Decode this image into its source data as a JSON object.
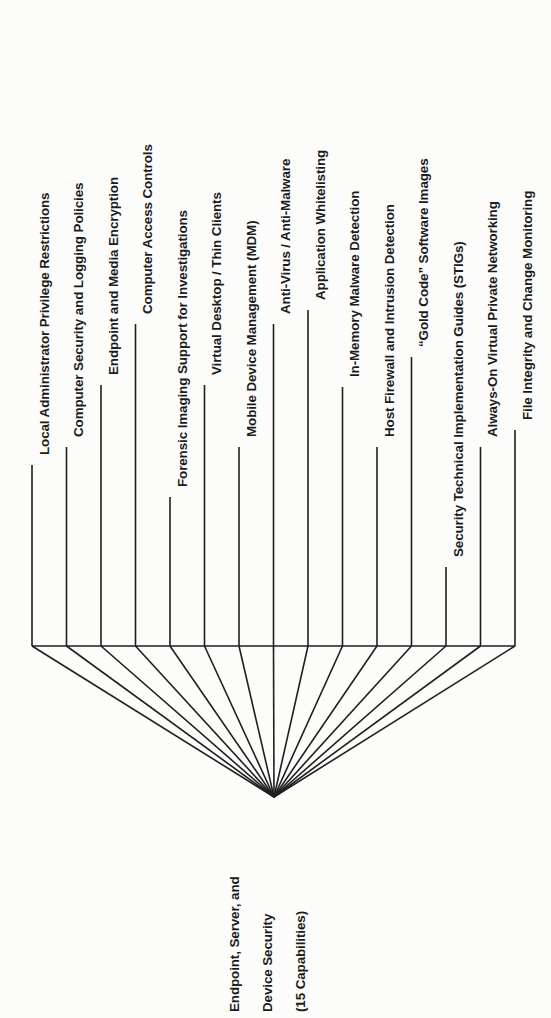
{
  "diagram": {
    "type": "fan-tree",
    "orientation": "rotated-90-ccw",
    "root": {
      "name": "root-node",
      "lines": [
        "Endpoint, Server, and",
        "Device Security",
        "(15 Capabilities)"
      ],
      "capability_count": 15
    },
    "ink_color": "#1f1f1f",
    "background_color": "#fcfcfa",
    "leaves": [
      {
        "index": 1,
        "label": "Local Administrator Privilege Restrictions"
      },
      {
        "index": 2,
        "label": "Computer Security and Logging Policies"
      },
      {
        "index": 3,
        "label": "Endpoint and Media Encryption"
      },
      {
        "index": 4,
        "label": "Computer Access Controls"
      },
      {
        "index": 5,
        "label": "Forensic Imaging Support for Investigations"
      },
      {
        "index": 6,
        "label": "Virtual Desktop / Thin Clients"
      },
      {
        "index": 7,
        "label": "Mobile Device Management (MDM)"
      },
      {
        "index": 8,
        "label": "Anti-Virus / Anti-Malware"
      },
      {
        "index": 9,
        "label": "Application Whitelisting"
      },
      {
        "index": 10,
        "label": "In-Memory Malware Detection"
      },
      {
        "index": 11,
        "label": "Host Firewall and Intrusion Detection"
      },
      {
        "index": 12,
        "label": "“Gold Code” Software Images"
      },
      {
        "index": 13,
        "label": "Security Technical Implementation Guides (STIGs)"
      },
      {
        "index": 14,
        "label": "Always-On Virtual Private Networking"
      },
      {
        "index": 15,
        "label": "File Integrity and Change Monitoring"
      }
    ]
  },
  "geometry": {
    "leaf_x": [
      32,
      66.5,
      101,
      135.5,
      170,
      204.5,
      239,
      273.5,
      308,
      342.5,
      377,
      411.5,
      446,
      480.5,
      515
    ],
    "leaf_line_top_y": [
      465,
      447,
      385,
      324,
      497,
      385,
      447,
      324,
      310,
      387,
      447,
      357,
      567,
      447,
      430
    ],
    "label_baseline_y": [
      455,
      437,
      375,
      314,
      487,
      375,
      437,
      314,
      300,
      377,
      437,
      347,
      557,
      437,
      420
    ],
    "bar_y": 646,
    "bar_x_start": 32,
    "bar_x_end": 515,
    "apex_x": 274,
    "apex_y": 797,
    "root_label_x": [
      228,
      261,
      294
    ],
    "root_label_baseline_y": 1012
  }
}
